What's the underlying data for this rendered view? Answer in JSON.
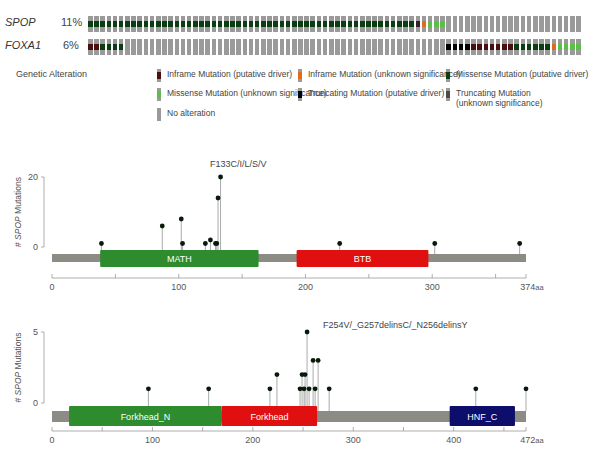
{
  "oncoprint": {
    "num_samples": 80,
    "colors": {
      "none": "#9a9a9a",
      "missense_driver": "#0b3d12",
      "missense_vus": "#5cbf4a",
      "inframe_driver": "#4a0f0f",
      "inframe_vus": "#e06a20",
      "truncating_driver": "#000000",
      "truncating_vus": "#4a4a4a",
      "inframe_driver_alt": "#3a1a30"
    },
    "rows": [
      {
        "gene": "SPOP",
        "percent": "11%",
        "segments": [
          {
            "type": "missense_driver",
            "count": 53
          },
          {
            "type": "inframe_driver_alt",
            "count": 1
          },
          {
            "type": "inframe_vus",
            "count": 1
          },
          {
            "type": "missense_vus",
            "count": 3
          },
          {
            "type": "none",
            "count": 22
          }
        ]
      },
      {
        "gene": "FOXA1",
        "percent": "6%",
        "segments": [
          {
            "type": "inframe_driver",
            "count": 2
          },
          {
            "type": "missense_driver",
            "count": 4
          },
          {
            "type": "none",
            "count": 52
          },
          {
            "type": "truncating_driver",
            "count": 4
          },
          {
            "type": "inframe_driver",
            "count": 7
          },
          {
            "type": "missense_driver",
            "count": 6
          },
          {
            "type": "inframe_vus",
            "count": 1
          },
          {
            "type": "missense_vus",
            "count": 4
          }
        ]
      }
    ],
    "legend": {
      "title": "Genetic Alteration",
      "items": [
        {
          "label": "Inframe Mutation (putative driver)",
          "type": "inframe_driver"
        },
        {
          "label": "Inframe Mutation (unknown significance)",
          "type": "inframe_vus"
        },
        {
          "label": "Missense Mutation (putative driver)",
          "type": "missense_driver"
        },
        {
          "label": "Missense Mutation (unknown significance)",
          "type": "missense_vus"
        },
        {
          "label": "Truncating Mutation (putative driver)",
          "type": "truncating_driver"
        },
        {
          "label": "Truncating Mutation\n(unknown significance)",
          "type": "truncating_vus"
        },
        {
          "label": "No alteration",
          "type": "none"
        }
      ]
    }
  },
  "chart_data": [
    {
      "type": "lollipop",
      "title": "SPOP",
      "annotation": "F133C/I/L/S/V",
      "ylabel": "# SPOP Mutations",
      "xlabel_suffix": "aa",
      "protein_length": 374,
      "ylim": [
        0,
        20
      ],
      "yticks": [
        0,
        20
      ],
      "xticks": [
        "0",
        "100",
        "200",
        "300",
        "374"
      ],
      "domains": [
        {
          "name": "MATH",
          "start": 38,
          "end": 163,
          "color": "#2e8b2e"
        },
        {
          "name": "BTB",
          "start": 193,
          "end": 297,
          "color": "#e01010"
        }
      ],
      "mutations": [
        {
          "pos": 39,
          "count": 1
        },
        {
          "pos": 87,
          "count": 6
        },
        {
          "pos": 102,
          "count": 8
        },
        {
          "pos": 103,
          "count": 1
        },
        {
          "pos": 121,
          "count": 1
        },
        {
          "pos": 125,
          "count": 2
        },
        {
          "pos": 129,
          "count": 1
        },
        {
          "pos": 130,
          "count": 1
        },
        {
          "pos": 131,
          "count": 14
        },
        {
          "pos": 133,
          "count": 20
        },
        {
          "pos": 227,
          "count": 1
        },
        {
          "pos": 302,
          "count": 1
        },
        {
          "pos": 369,
          "count": 1
        }
      ]
    },
    {
      "type": "lollipop",
      "title": "FOXA1",
      "annotation": "F254V/_G257delinsC/_N256delinsY",
      "ylabel": "# SPOP Mutations",
      "xlabel_suffix": "aa",
      "protein_length": 472,
      "ylim": [
        0,
        5
      ],
      "yticks": [
        0,
        5
      ],
      "xticks": [
        "0",
        "100",
        "200",
        "300",
        "400",
        "472"
      ],
      "domains": [
        {
          "name": "Forkhead_N",
          "start": 17,
          "end": 169,
          "color": "#2e8b2e"
        },
        {
          "name": "Forkhead",
          "start": 169,
          "end": 264,
          "color": "#e01010"
        },
        {
          "name": "HNF_C",
          "start": 396,
          "end": 461,
          "color": "#0d0d6b"
        }
      ],
      "mutations": [
        {
          "pos": 96,
          "count": 1
        },
        {
          "pos": 156,
          "count": 1
        },
        {
          "pos": 217,
          "count": 1
        },
        {
          "pos": 224,
          "count": 2
        },
        {
          "pos": 247,
          "count": 1
        },
        {
          "pos": 249,
          "count": 2
        },
        {
          "pos": 251,
          "count": 1
        },
        {
          "pos": 252,
          "count": 2
        },
        {
          "pos": 254,
          "count": 5
        },
        {
          "pos": 256,
          "count": 1
        },
        {
          "pos": 260,
          "count": 3
        },
        {
          "pos": 262,
          "count": 1
        },
        {
          "pos": 265,
          "count": 3
        },
        {
          "pos": 276,
          "count": 1
        },
        {
          "pos": 422,
          "count": 1
        },
        {
          "pos": 472,
          "count": 1
        }
      ]
    }
  ]
}
